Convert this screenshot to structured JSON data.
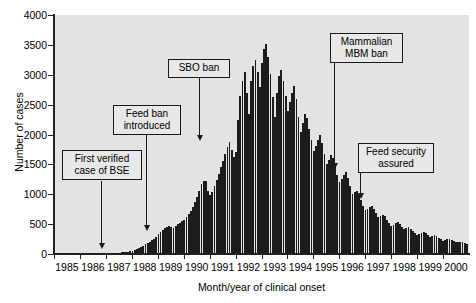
{
  "chart_data": {
    "type": "bar",
    "title": "",
    "xlabel": "Month/year of clinical onset",
    "ylabel": "Number of cases",
    "ylim": [
      0,
      4000
    ],
    "ytick_labels": [
      "0",
      "500",
      "1000",
      "1500",
      "2000",
      "2500",
      "3000",
      "3500",
      "4000"
    ],
    "ytick_values": [
      0,
      500,
      1000,
      1500,
      2000,
      2500,
      3000,
      3500,
      4000
    ],
    "xtick_labels": [
      "1985",
      "1986",
      "1987",
      "1988",
      "1989",
      "1990",
      "1991",
      "1992",
      "1993",
      "1994",
      "1995",
      "1996",
      "1997",
      "1998",
      "1999",
      "2000"
    ],
    "grid": false,
    "legend": "none",
    "bar_color": "#1c1c1c",
    "plot_bg": "#e3e3e3",
    "x_start_year": 1985,
    "x_interval": "month",
    "values": [
      0,
      0,
      0,
      0,
      0,
      0,
      0,
      0,
      0,
      0,
      0,
      0,
      2,
      2,
      3,
      2,
      3,
      4,
      3,
      5,
      4,
      6,
      5,
      7,
      6,
      8,
      10,
      12,
      14,
      18,
      22,
      26,
      30,
      36,
      42,
      50,
      58,
      70,
      86,
      100,
      118,
      140,
      160,
      185,
      205,
      230,
      258,
      290,
      330,
      370,
      400,
      430,
      455,
      470,
      455,
      440,
      470,
      500,
      520,
      545,
      575,
      620,
      670,
      720,
      790,
      870,
      960,
      1060,
      1165,
      1230,
      1215,
      1050,
      980,
      1030,
      1130,
      1240,
      1345,
      1450,
      1560,
      1680,
      1790,
      1880,
      1745,
      1620,
      1700,
      2250,
      2640,
      2900,
      3040,
      2700,
      2350,
      2900,
      3150,
      3250,
      3050,
      2800,
      3200,
      3430,
      3520,
      3300,
      3010,
      2620,
      2300,
      2700,
      2980,
      3080,
      2900,
      2650,
      2400,
      2550,
      2700,
      2820,
      2600,
      2300,
      2050,
      2200,
      2350,
      2280,
      2100,
      1900,
      1720,
      1800,
      1900,
      2000,
      1860,
      1680,
      1500,
      1580,
      1660,
      1600,
      1460,
      1320,
      1200,
      1260,
      1320,
      1380,
      1280,
      1140,
      1000,
      1040,
      1060,
      1000,
      900,
      810,
      730,
      760,
      790,
      810,
      750,
      680,
      620,
      640,
      660,
      630,
      570,
      520,
      470,
      490,
      520,
      540,
      500,
      455,
      415,
      430,
      445,
      425,
      390,
      355,
      325,
      340,
      355,
      370,
      345,
      315,
      290,
      300,
      310,
      295,
      270,
      245,
      225,
      235,
      245,
      250,
      235,
      215,
      195,
      200,
      205,
      195,
      178,
      160
    ]
  },
  "annotations": [
    {
      "id": "first-verified-case",
      "text": "First verified\ncase of BSE",
      "box_left": 62,
      "box_top": 150,
      "box_width": 80,
      "line_x": 101,
      "line_top": 181,
      "line_height": 63,
      "arrow_top": 243
    },
    {
      "id": "feed-ban-introduced",
      "text": "Feed ban\nintroduced",
      "box_left": 113,
      "box_top": 105,
      "box_width": 68,
      "line_x": 146,
      "line_top": 134,
      "line_height": 92,
      "arrow_top": 225
    },
    {
      "id": "sbo-ban",
      "text": "SBO ban",
      "box_left": 168,
      "box_top": 59,
      "box_width": 62,
      "line_x": 199,
      "line_top": 77,
      "line_height": 59,
      "arrow_top": 135
    },
    {
      "id": "mammalian-mbm-ban",
      "text": "Mammalian\nMBM ban",
      "box_left": 330,
      "box_top": 33,
      "box_width": 73,
      "line_x": 334,
      "line_top": 63,
      "line_height": 101,
      "arrow_top": 163
    },
    {
      "id": "feed-security-assured",
      "text": "Feed security\nassured",
      "box_left": 358,
      "box_top": 143,
      "box_width": 76,
      "line_x": 360,
      "line_top": 173,
      "line_height": 21,
      "arrow_top": 193
    }
  ]
}
